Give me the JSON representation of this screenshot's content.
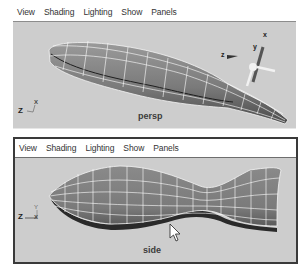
{
  "app": "Maya",
  "panels": [
    {
      "id": "persp",
      "active": false,
      "menu": [
        "View",
        "Shading",
        "Lighting",
        "Show",
        "Panels"
      ],
      "camera_label": "persp",
      "axis_triad": {
        "labels": [
          "Z",
          "X"
        ]
      },
      "manipulator": {
        "labels": [
          "x",
          "y",
          "z"
        ]
      },
      "object": "fish NURBS surface (perspective view)"
    },
    {
      "id": "side",
      "active": true,
      "menu": [
        "View",
        "Shading",
        "Lighting",
        "Show",
        "Panels"
      ],
      "camera_label": "side",
      "axis_triad": {
        "labels": [
          "Z",
          "Y"
        ]
      },
      "object": "fish NURBS surface (side view)",
      "cursor": "arrow-pointer"
    }
  ],
  "colors": {
    "viewport_bg": "#cdcdcd",
    "surface_fill": "#7d7d7d",
    "wireframe": "#ffffff",
    "active_border": "#3a3a3a"
  }
}
